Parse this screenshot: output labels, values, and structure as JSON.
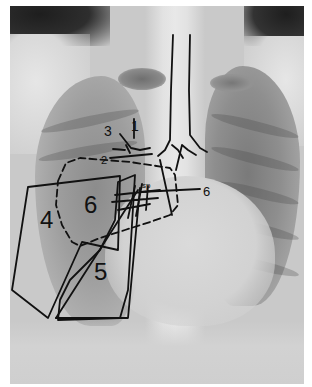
{
  "image": {
    "type": "chest-radiograph-annotated",
    "view": "frontal"
  },
  "annotations": {
    "labels": [
      {
        "id": "label-1",
        "text": "1",
        "x": 133,
        "y": 131
      },
      {
        "id": "label-2",
        "text": "2",
        "x": 101,
        "y": 162
      },
      {
        "id": "label-3",
        "text": "3",
        "x": 108,
        "y": 134
      },
      {
        "id": "label-4",
        "text": "4",
        "x": 42,
        "y": 224
      },
      {
        "id": "label-5",
        "text": "5",
        "x": 96,
        "y": 276
      },
      {
        "id": "label-6-left",
        "text": "6",
        "x": 86,
        "y": 208
      },
      {
        "id": "label-6-right",
        "text": "6",
        "x": 206,
        "y": 193
      },
      {
        "id": "label-small-cluster",
        "text": "sp",
        "x": 145,
        "y": 187
      }
    ]
  },
  "colors": {
    "ink": "#111111",
    "border": "#ffffff",
    "film_base": "#c9c9c9"
  }
}
